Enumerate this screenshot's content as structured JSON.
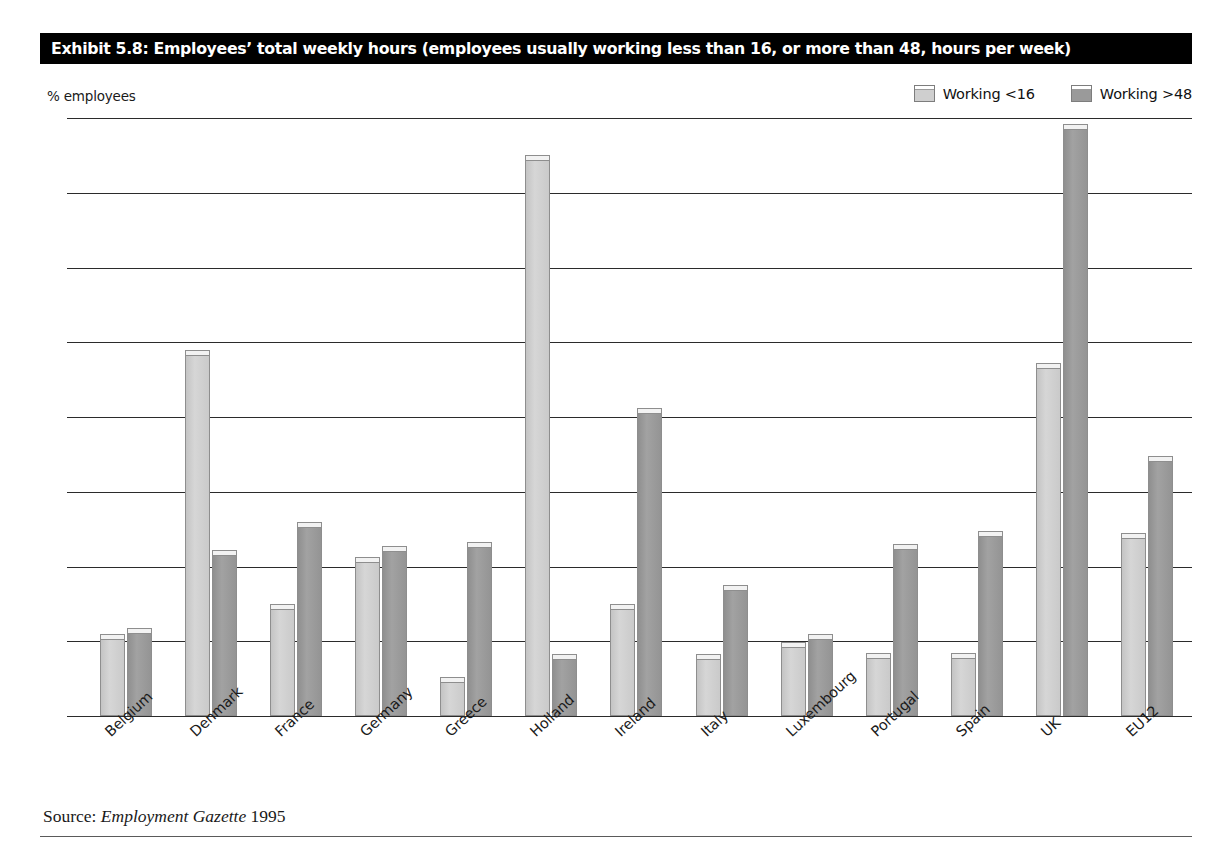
{
  "exhibit": {
    "title": "Exhibit 5.8: Employees’ total weekly hours (employees usually working less than 16, or more than 48, hours per week)",
    "source_prefix": "Source: ",
    "source_journal": "Employment Gazette",
    "source_year": " 1995"
  },
  "colors": {
    "title_background": "#000000",
    "title_text": "#ffffff",
    "series_light": "#cfcfcf",
    "series_dark": "#9a9a9a",
    "axis": "#2b2b2b",
    "page_background": "#ffffff"
  },
  "chart_data": {
    "type": "bar",
    "title": "Exhibit 5.8: Employees’ total weekly hours (employees usually working less than 16, or more than 48, hours per week)",
    "xlabel": "",
    "ylabel": "% employees",
    "ylim": [
      0,
      16
    ],
    "yticks": [
      0,
      2,
      4,
      6,
      8,
      10,
      12,
      14,
      16
    ],
    "ytick_labels": [
      "0",
      "2",
      "4",
      "6",
      "8",
      "10",
      "12",
      "14",
      "16"
    ],
    "grid": true,
    "legend_position": "top-right",
    "categories": [
      "Belgium",
      "Denmark",
      "France",
      "Germany",
      "Greece",
      "Holland",
      "Ireland",
      "Italy",
      "Luxembourg",
      "Portugal",
      "Spain",
      "UK",
      "EU12"
    ],
    "series": [
      {
        "name": "Working <16",
        "color": "#cfcfcf",
        "values": [
          2.2,
          9.8,
          3.0,
          4.25,
          1.05,
          15.0,
          3.0,
          1.65,
          1.98,
          1.68,
          1.68,
          9.45,
          4.9
        ]
      },
      {
        "name": "Working >48",
        "color": "#9a9a9a",
        "values": [
          2.35,
          4.45,
          5.2,
          4.55,
          4.65,
          1.65,
          8.25,
          3.5,
          2.2,
          4.6,
          4.95,
          15.85,
          6.95
        ]
      }
    ]
  }
}
